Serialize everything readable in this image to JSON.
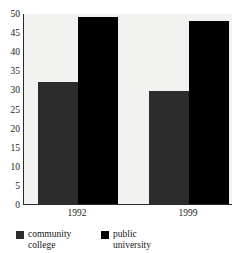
{
  "chart_data": {
    "type": "bar",
    "title": "",
    "top_clipped_caption": "",
    "categories": [
      "1992",
      "1999"
    ],
    "series": [
      {
        "name": "community college",
        "color": "#2c2c2c",
        "values": [
          32,
          29.5
        ]
      },
      {
        "name": "public university",
        "color": "#000000",
        "values": [
          49,
          48
        ]
      }
    ],
    "xlabel": "",
    "ylabel": "",
    "ylim": [
      0,
      50
    ],
    "ytick_values": [
      0,
      5,
      10,
      15,
      20,
      25,
      30,
      35,
      40,
      45,
      50
    ],
    "ytick_labels": [
      "0",
      "5",
      "10",
      "15",
      "20",
      "25",
      "30",
      "35",
      "40",
      "45",
      "50"
    ],
    "grid": false,
    "legend_position": "bottom-left",
    "plot_background": "#f2f2f0",
    "axis_color": "#2a2a2a"
  },
  "legend": {
    "entries": [
      {
        "label": "community college",
        "color": "#2c2c2c"
      },
      {
        "label": "public university",
        "color": "#000000"
      }
    ]
  }
}
